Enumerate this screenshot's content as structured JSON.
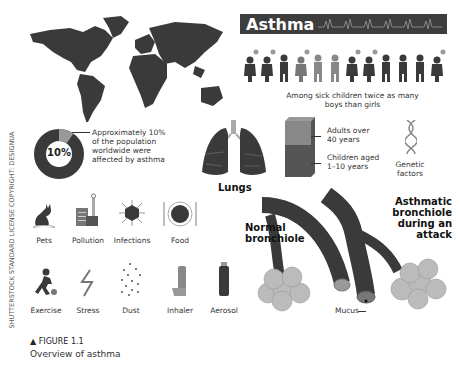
{
  "title": {
    "text": "Asthma"
  },
  "children_caption": {
    "line1": "Among sick children twice as many",
    "line2": "boys than girls"
  },
  "prevalence": {
    "value": "10%",
    "line1": "Approximately 10%",
    "line2": "of the population",
    "line3": "worldwide were",
    "line4": "affected by asthma"
  },
  "lungs": {
    "label": "Lungs"
  },
  "age_groups": {
    "adults": "Adults over",
    "adults2": "40 years",
    "children": "Children aged",
    "children2": "1–10 years"
  },
  "genetic": {
    "line1": "Genetic",
    "line2": "factors"
  },
  "triggers": [
    {
      "label": "Pets"
    },
    {
      "label": "Pollution"
    },
    {
      "label": "Infections"
    },
    {
      "label": "Food"
    }
  ],
  "triggers2": [
    {
      "label": "Exercise"
    },
    {
      "label": "Stress"
    },
    {
      "label": "Dust"
    },
    {
      "label": "Inhaler"
    },
    {
      "label": "Aerosol"
    }
  ],
  "bronchiole": {
    "normal1": "Normal",
    "normal2": "bronchiole",
    "asthmatic1": "Asthmatic",
    "asthmatic2": "bronchiole",
    "asthmatic3": "during an",
    "asthmatic4": "attack",
    "mucus": "Mucus"
  },
  "credit": {
    "text": "SHUTTERSTOCK STANDARD LICENSE   COPYRIGHT: DESIGNUA"
  },
  "figure": {
    "label": "FIGURE 1.1",
    "caption": "Overview of asthma"
  },
  "colors": {
    "dark": "#3a3a3a",
    "mid": "#777777",
    "light": "#b5b5b5",
    "banner": "#3d3d3d"
  }
}
